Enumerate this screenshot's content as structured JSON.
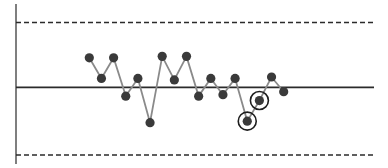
{
  "chart_data": {
    "type": "line",
    "title": "",
    "subtitle": "",
    "xlabel": "",
    "ylabel": "",
    "grid": false,
    "legend": null,
    "x": [
      1,
      2,
      3,
      4,
      5,
      6,
      7,
      8,
      9,
      10,
      11,
      12,
      13,
      14,
      15,
      16,
      17
    ],
    "values": [
      1.0,
      0.3,
      1.0,
      -0.3,
      0.3,
      -1.2,
      1.05,
      0.25,
      1.05,
      -0.3,
      0.3,
      -0.25,
      0.3,
      -1.15,
      -0.45,
      0.35,
      -0.15
    ],
    "center_line": 0,
    "upper_control_limit": 2.2,
    "lower_control_limit": -2.2,
    "ylim": [
      -2.5,
      2.5
    ],
    "highlighted_points": [
      14,
      15
    ],
    "colors": {
      "points": "#3a3a3a",
      "series_line": "#8a8a8a",
      "center_line": "#2b2b2b",
      "limit_lines": "#2b2b2b",
      "axis": "#555555",
      "highlight_ring": "#1e1e1e"
    }
  }
}
